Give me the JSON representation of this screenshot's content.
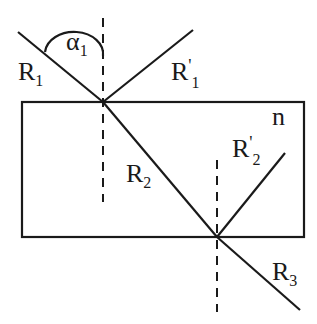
{
  "diagram": {
    "medium_label": "n",
    "angle_label": {
      "main": "α",
      "sub": "1"
    },
    "rays": [
      {
        "id": "R1",
        "main": "R",
        "sub": "1",
        "prime": "",
        "role": "incident ray"
      },
      {
        "id": "R1p",
        "main": "R",
        "sub": "1",
        "prime": "'",
        "role": "reflected ray at top surface"
      },
      {
        "id": "R2",
        "main": "R",
        "sub": "2",
        "prime": "",
        "role": "refracted ray inside slab"
      },
      {
        "id": "R2p",
        "main": "R",
        "sub": "2",
        "prime": "'",
        "role": "reflected ray at bottom surface"
      },
      {
        "id": "R3",
        "main": "R",
        "sub": "3",
        "prime": "",
        "role": "emergent ray"
      }
    ],
    "colors": {
      "line": "#1a1a1a",
      "background": "#ffffff"
    }
  }
}
